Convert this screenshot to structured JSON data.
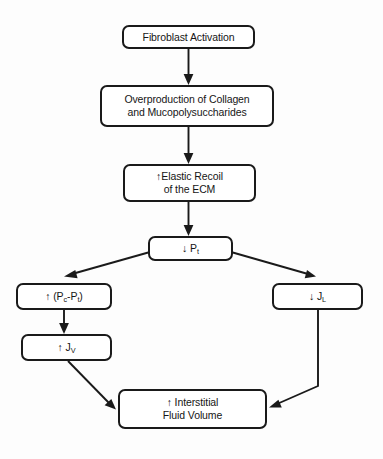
{
  "diagram": {
    "type": "flowchart",
    "background_color": "#fdfdfd",
    "stroke_color": "#1a1a1a",
    "text_color": "#161616",
    "nodes": [
      {
        "id": "fibroblast-activation",
        "label": "Fibroblast Activation",
        "x": 122,
        "y": 25,
        "w": 133,
        "h": 24
      },
      {
        "id": "overproduction-collagen",
        "label": "Overproduction of Collagen\nand Mucopolysuccharides",
        "x": 100,
        "y": 85,
        "w": 174,
        "h": 42
      },
      {
        "id": "elastic-recoil",
        "label": "↑Elastic Recoil\nof the ECM",
        "x": 123,
        "y": 164,
        "w": 133,
        "h": 38
      },
      {
        "id": "decreased-pt",
        "label_html": "↓ P<sub>t</sub>",
        "label": "↓ Pt",
        "x": 148,
        "y": 236,
        "w": 85,
        "h": 25
      },
      {
        "id": "increased-pc-minus-pt",
        "label_html": "↑ (P<sub>c</sub>-P<sub>t</sub>)",
        "label": "↑ (Pc-Pt)",
        "x": 16,
        "y": 283,
        "w": 96,
        "h": 27
      },
      {
        "id": "decreased-jl",
        "label_html": "↓ J<sub>L</sub>",
        "label": "↓ JL",
        "x": 272,
        "y": 283,
        "w": 91,
        "h": 27
      },
      {
        "id": "increased-jv",
        "label_html": "↑ J<sub>V</sub>",
        "label": "↑ JV",
        "x": 21,
        "y": 334,
        "w": 91,
        "h": 27
      },
      {
        "id": "interstitial-fluid-volume",
        "label": "↑ Interstitial\nFluid Volume",
        "x": 118,
        "y": 389,
        "w": 149,
        "h": 40
      }
    ],
    "edges": [
      {
        "id": "edge-activation-to-overproduction",
        "from": "fibroblast-activation",
        "to": "overproduction-collagen",
        "style": "straight-vertical"
      },
      {
        "id": "edge-overproduction-to-recoil",
        "from": "overproduction-collagen",
        "to": "elastic-recoil",
        "style": "straight-vertical"
      },
      {
        "id": "edge-recoil-to-pt",
        "from": "elastic-recoil",
        "to": "decreased-pt",
        "style": "straight-vertical"
      },
      {
        "id": "edge-pt-to-pc-minus-pt",
        "from": "decreased-pt",
        "to": "increased-pc-minus-pt",
        "style": "diagonal-left"
      },
      {
        "id": "edge-pt-to-jl",
        "from": "decreased-pt",
        "to": "decreased-jl",
        "style": "diagonal-right"
      },
      {
        "id": "edge-pc-minus-pt-to-jv",
        "from": "increased-pc-minus-pt",
        "to": "increased-jv",
        "style": "straight-vertical"
      },
      {
        "id": "edge-jv-to-fluid-volume",
        "from": "increased-jv",
        "to": "interstitial-fluid-volume",
        "style": "diagonal-right-down"
      },
      {
        "id": "edge-jl-to-fluid-volume",
        "from": "decreased-jl",
        "to": "interstitial-fluid-volume",
        "style": "elbow-down-then-diagonal-left"
      }
    ]
  }
}
